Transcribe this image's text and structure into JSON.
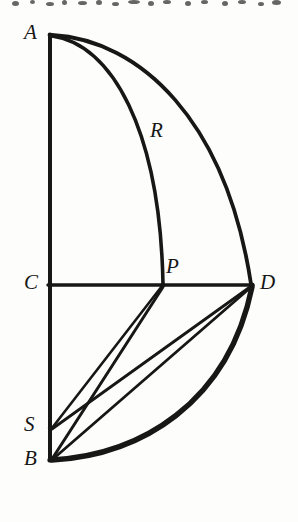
{
  "figure": {
    "background_color": "#fdfdfc",
    "ink_color": "#171715",
    "width": 298,
    "height": 522
  },
  "points": [
    {
      "id": "A",
      "label": "A",
      "x": 50,
      "y": 35,
      "label_x": 24,
      "label_y": 22
    },
    {
      "id": "R",
      "label": "R",
      "x": 160,
      "y": 133,
      "label_x": 150,
      "label_y": 120
    },
    {
      "id": "C",
      "label": "C",
      "x": 50,
      "y": 285,
      "label_x": 24,
      "label_y": 272
    },
    {
      "id": "P",
      "label": "P",
      "x": 163,
      "y": 285,
      "label_x": 166,
      "label_y": 256
    },
    {
      "id": "D",
      "label": "D",
      "x": 252,
      "y": 285,
      "label_x": 260,
      "label_y": 272
    },
    {
      "id": "S",
      "label": "S",
      "x": 50,
      "y": 428,
      "label_x": 24,
      "label_y": 414
    },
    {
      "id": "B",
      "label": "B",
      "x": 50,
      "y": 460,
      "label_x": 24,
      "label_y": 448
    }
  ],
  "strokes": {
    "vertical_AB": {
      "name": "line-A-B",
      "d": "M 50 35 L 50 460",
      "width": 4.0
    },
    "horizontal_CD": {
      "name": "line-C-D",
      "d": "M 48 285 L 253 285",
      "width": 3.4
    },
    "arc_A_P": {
      "name": "arc-A-P",
      "d": "M 52 36 C 112 44 160 130 163 284",
      "width": 3.6
    },
    "arc_A_D": {
      "name": "arc-A-D",
      "d": "M 52 35 C 140 40 226 120 251 284",
      "width": 3.8
    },
    "arc_B_D": {
      "name": "arc-B-D",
      "d": "M 52 460 C 140 455 228 404 252 287",
      "width": 5.4
    },
    "chord_S_P": {
      "name": "line-S-P",
      "d": "M 52 428 L 162 286",
      "width": 2.6
    },
    "chord_S_D": {
      "name": "line-S-D",
      "d": "M 52 429 L 250 287",
      "width": 2.8
    },
    "chord_B_P": {
      "name": "line-B-P",
      "d": "M 52 459 L 163 287",
      "width": 3.0
    },
    "chord_B_D": {
      "name": "line-B-D",
      "d": "M 53 459 L 250 288",
      "width": 2.8
    }
  },
  "artifacts": {
    "top_band_note": "row of clipped descenders from the text line above the figure"
  }
}
